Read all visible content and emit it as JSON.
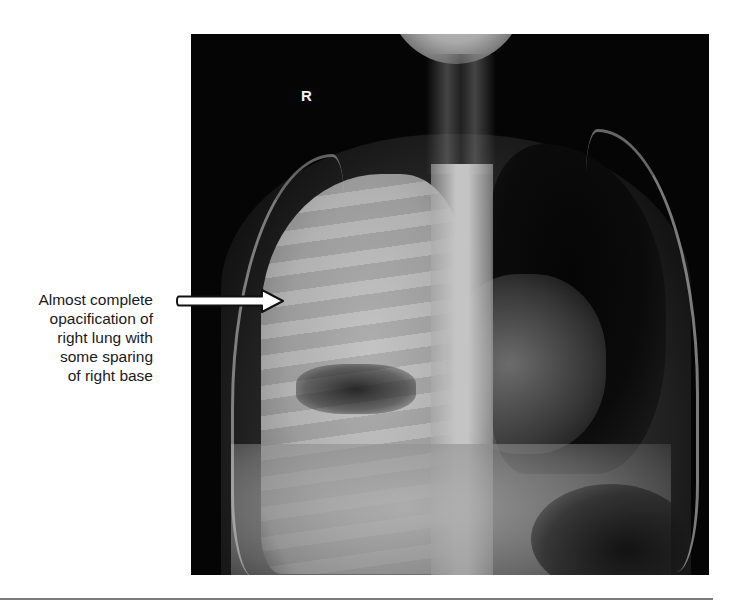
{
  "figure": {
    "caption_lines": [
      "Almost complete",
      "opacification of",
      "right lung with",
      "some sparing",
      "of right base"
    ],
    "side_marker": "R",
    "image_type": "chest radiograph",
    "arrow_icon": "arrow-right-icon",
    "colors": {
      "background": "#ffffff",
      "xray_background": "#050505",
      "caption_text": "#1a1a1a",
      "arrow_fill": "#ffffff",
      "arrow_outline": "#111111",
      "rule": "#7a7a7a"
    }
  }
}
